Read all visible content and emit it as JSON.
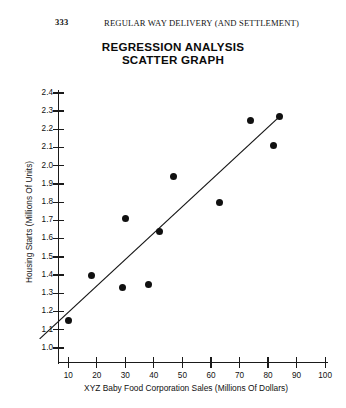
{
  "page": {
    "folio": "333",
    "running_head": "REGULAR WAY DELIVERY (AND SETTLEMENT)"
  },
  "chart_data": {
    "type": "scatter",
    "title": "REGRESSION ANALYSIS SCATTER GRAPH",
    "title_line1": "REGRESSION ANALYSIS",
    "title_line2": "SCATTER GRAPH",
    "xlabel": "XYZ Baby Food Corporation Sales (Millions Of Dollars)",
    "ylabel": "Housing Starts (Millions Of Units)",
    "xlim": [
      0,
      105
    ],
    "ylim": [
      1.0,
      2.45
    ],
    "grid": false,
    "legend": null,
    "xticks": [
      10,
      20,
      30,
      40,
      50,
      60,
      70,
      80,
      90,
      100
    ],
    "xtick_labels": [
      "10",
      "20",
      "30",
      "40",
      "50",
      "60",
      "70",
      "80",
      "90",
      "100"
    ],
    "yticks": [
      1.0,
      1.1,
      1.2,
      1.3,
      1.4,
      1.5,
      1.6,
      1.7,
      1.8,
      1.9,
      2.0,
      2.1,
      2.2,
      2.3,
      2.4
    ],
    "ytick_labels": [
      "1.0",
      "1.1",
      "1.2",
      "1.3",
      "1.4",
      "1.5",
      "1.6",
      "1.7",
      "1.8",
      "1.9",
      "2.0",
      "2.1",
      "2.2",
      "2.3",
      "2.4"
    ],
    "x": [
      10,
      18,
      29,
      30,
      38,
      42,
      47,
      63,
      74,
      82,
      84
    ],
    "y": [
      1.15,
      1.4,
      1.33,
      1.71,
      1.35,
      1.64,
      1.94,
      1.8,
      2.25,
      2.11,
      2.27
    ],
    "points": [
      {
        "x": 10,
        "y": 1.15
      },
      {
        "x": 18,
        "y": 1.4
      },
      {
        "x": 29,
        "y": 1.33
      },
      {
        "x": 30,
        "y": 1.71
      },
      {
        "x": 38,
        "y": 1.35
      },
      {
        "x": 42,
        "y": 1.64
      },
      {
        "x": 47,
        "y": 1.94
      },
      {
        "x": 63,
        "y": 1.8
      },
      {
        "x": 74,
        "y": 2.25
      },
      {
        "x": 82,
        "y": 2.11
      },
      {
        "x": 84,
        "y": 2.27
      }
    ],
    "trendline": {
      "label": "regression line",
      "x_start": 0,
      "y_start": 1.05,
      "x_end": 84,
      "y_end": 2.27
    }
  }
}
